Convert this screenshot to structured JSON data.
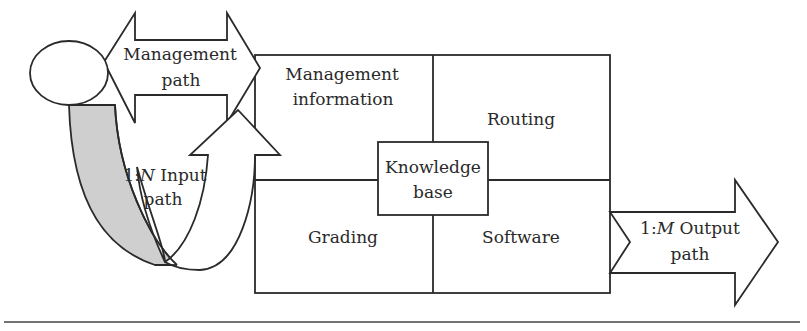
{
  "diagram": {
    "management_path": {
      "line1": "Management",
      "line2": "path"
    },
    "input_path": {
      "prefix": "1:",
      "italic": "N",
      "suffix": " Input",
      "line2": "path"
    },
    "output_path": {
      "prefix": "1:",
      "italic": "M",
      "suffix": " Output",
      "line2": "path"
    },
    "quadrants": {
      "top_left": {
        "line1": "Management",
        "line2": "information"
      },
      "top_right": {
        "label": "Routing"
      },
      "bottom_left": {
        "label": "Grading"
      },
      "bottom_right": {
        "label": "Software"
      }
    },
    "center_box": {
      "line1": "Knowledge",
      "line2": "base"
    },
    "colors": {
      "stroke": "#2a2a2a",
      "band_fill": "#cfcfcf",
      "background": "#ffffff"
    }
  }
}
